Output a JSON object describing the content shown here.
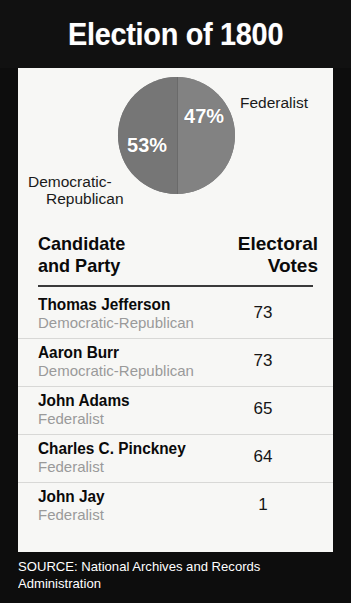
{
  "title": "Election of 1800",
  "chart_data": {
    "type": "pie",
    "title": "Election of 1800",
    "categories": [
      "Democratic-Republican",
      "Federalist"
    ],
    "values": [
      53,
      47
    ],
    "value_labels": [
      "53%",
      "47%"
    ],
    "unit": "percent",
    "legend": "inline-labels",
    "colors": [
      "#767676",
      "#828282"
    ],
    "labels": {
      "left_slice": "Democratic-",
      "left_slice_line2": "Republican",
      "right_slice": "Federalist"
    }
  },
  "table": {
    "headers": {
      "candidate_line1": "Candidate",
      "candidate_line2": "and Party",
      "votes_line1": "Electoral",
      "votes_line2": "Votes"
    },
    "rows": [
      {
        "name": "Thomas Jefferson",
        "party": "Democratic-Republican",
        "votes": "73"
      },
      {
        "name": "Aaron Burr",
        "party": "Democratic-Republican",
        "votes": "73"
      },
      {
        "name": "John Adams",
        "party": "Federalist",
        "votes": "65"
      },
      {
        "name": "Charles C. Pinckney",
        "party": "Federalist",
        "votes": "64"
      },
      {
        "name": "John Jay",
        "party": "Federalist",
        "votes": "1"
      }
    ]
  },
  "source": {
    "line1": "SOURCE: National Archives and Records",
    "line2": "Administration"
  }
}
